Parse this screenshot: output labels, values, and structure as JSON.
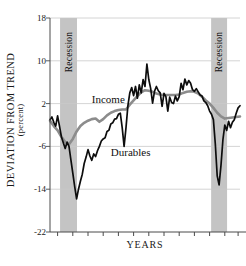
{
  "chart_data": {
    "type": "line",
    "title": "",
    "xlabel": "YEARS",
    "ylabel": "DEVIATION FROM TREND",
    "ylabel_sub": "(percent)",
    "ylim": [
      -22,
      18
    ],
    "yticks": [
      18,
      10,
      2,
      -6,
      -14,
      -22
    ],
    "ytick_labels": [
      "18",
      "10",
      "2",
      "-6",
      "-14",
      "-22"
    ],
    "xlim": [
      0,
      100
    ],
    "xticks": [
      4,
      12,
      20,
      28,
      36,
      44,
      52,
      60,
      68,
      76,
      84,
      92,
      99
    ],
    "xtick_labels": [
      "",
      "",
      "",
      "",
      "",
      "",
      "",
      "",
      "",
      "",
      "",
      "",
      ""
    ],
    "grid": "horizontal",
    "legend_position": "inline-annotations",
    "annotations": [
      {
        "text": "Income",
        "x": 22,
        "y": 2.5,
        "series": "Income"
      },
      {
        "text": "Durables",
        "x": 32,
        "y": -7.5,
        "series": "Durables"
      },
      {
        "text": "Recession",
        "x": 6.8,
        "y": 11,
        "kind": "band-label"
      },
      {
        "text": "Recession",
        "x": 86.5,
        "y": 11,
        "kind": "band-label"
      }
    ],
    "bands": [
      {
        "label": "Recession",
        "x0": 5.3,
        "x1": 14.2,
        "color": "#c4c4c4"
      },
      {
        "label": "Recession",
        "x0": 84.8,
        "x1": 93.2,
        "color": "#c4c4c4"
      }
    ],
    "series": [
      {
        "name": "Income",
        "color": "#8c8c8c",
        "width": 2.6,
        "x": [
          0,
          2,
          4,
          6,
          8,
          10,
          12,
          14,
          16,
          18,
          20,
          22,
          24,
          26,
          28,
          30,
          32,
          34,
          36,
          38,
          40,
          42,
          44,
          46,
          48,
          50,
          52,
          54,
          56,
          58,
          60,
          62,
          64,
          66,
          68,
          70,
          72,
          74,
          76,
          78,
          80,
          82,
          84,
          86,
          88,
          90,
          92,
          94,
          96,
          98,
          100
        ],
        "values": [
          -1.2,
          -2.2,
          -3.0,
          -4.2,
          -5.2,
          -5.6,
          -4.6,
          -3.2,
          -2.2,
          -1.6,
          -1.2,
          -0.9,
          -0.8,
          -1.4,
          -0.9,
          -0.2,
          0.3,
          0.6,
          0.8,
          0.9,
          0.9,
          1.8,
          2.6,
          3.4,
          4.1,
          4.5,
          4.4,
          4.2,
          3.9,
          3.7,
          3.6,
          3.6,
          3.6,
          3.6,
          3.7,
          4.0,
          4.2,
          4.3,
          4.2,
          3.9,
          3.3,
          2.6,
          2.0,
          1.2,
          0.3,
          -0.4,
          -0.8,
          -0.7,
          -0.6,
          -0.5,
          -0.4
        ]
      },
      {
        "name": "Durables",
        "color": "#0d0d0d",
        "width": 1.7,
        "x": [
          0,
          1,
          2,
          3,
          4,
          5,
          6,
          7,
          8,
          9,
          10,
          11,
          12,
          13,
          14,
          15,
          16,
          17,
          18,
          19,
          20,
          21,
          22,
          23,
          24,
          25,
          26,
          27,
          28,
          29,
          30,
          31,
          32,
          33,
          34,
          35,
          36,
          37,
          38,
          39,
          40,
          41,
          42,
          43,
          44,
          45,
          46,
          47,
          48,
          49,
          50,
          51,
          52,
          53,
          54,
          55,
          56,
          57,
          58,
          59,
          60,
          61,
          62,
          63,
          64,
          65,
          66,
          67,
          68,
          69,
          70,
          71,
          72,
          73,
          74,
          75,
          76,
          77,
          78,
          79,
          80,
          81,
          82,
          83,
          84,
          85,
          86,
          87,
          88,
          89,
          90,
          91,
          92,
          93,
          94,
          95,
          96,
          97,
          98,
          99,
          100
        ],
        "values": [
          -1.0,
          -0.5,
          -1.5,
          -2.2,
          -0.3,
          -2.2,
          -4.2,
          -5.3,
          -6.4,
          -5.2,
          -6.0,
          -8.5,
          -11.0,
          -13.5,
          -15.8,
          -14.0,
          -12.5,
          -11.2,
          -9.2,
          -8.0,
          -6.6,
          -7.8,
          -8.6,
          -7.4,
          -7.9,
          -6.8,
          -6.0,
          -5.0,
          -4.6,
          -4.4,
          -3.2,
          -3.0,
          -1.8,
          -1.6,
          -0.9,
          -0.8,
          0.0,
          0.2,
          -2.5,
          -6.0,
          -2.5,
          1.6,
          4.0,
          5.0,
          3.5,
          5.2,
          3.0,
          5.5,
          4.0,
          6.5,
          5.2,
          9.4,
          6.5,
          4.8,
          2.1,
          4.3,
          5.2,
          4.4,
          4.0,
          1.5,
          3.9,
          3.3,
          0.6,
          3.2,
          2.2,
          2.0,
          3.4,
          2.5,
          3.3,
          5.8,
          4.6,
          6.6,
          5.5,
          6.3,
          5.8,
          4.6,
          4.3,
          4.8,
          4.2,
          3.6,
          3.4,
          2.5,
          2.2,
          1.6,
          0.6,
          0.0,
          -1.0,
          -5.5,
          -11.5,
          -13.2,
          -9.5,
          -4.8,
          -2.0,
          -3.0,
          -1.3,
          -2.5,
          -1.5,
          -1.0,
          0.2,
          1.2,
          1.6
        ]
      }
    ]
  },
  "axis": {
    "y_title": "DEVIATION FROM TREND",
    "y_subtitle": "(percent)",
    "x_title": "YEARS"
  },
  "bands": {
    "left_label": "Recession",
    "right_label": "Recession"
  },
  "series_labels": {
    "income": "Income",
    "durables": "Durables"
  },
  "colors": {
    "band": "#c4c4c4",
    "income": "#8c8c8c",
    "durables": "#0d0d0d",
    "grid": "#c9c9c9",
    "axis": "#4a4a4a",
    "text": "#1a1a1a"
  }
}
